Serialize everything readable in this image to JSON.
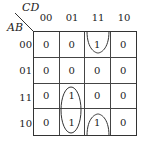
{
  "kmap": {
    "var_col": "CD",
    "var_row": "AB",
    "col_headers": [
      "00",
      "01",
      "11",
      "10"
    ],
    "row_headers": [
      "00",
      "01",
      "11",
      "10"
    ],
    "cells": [
      [
        "0",
        "0",
        "1",
        "0"
      ],
      [
        "0",
        "0",
        "0",
        "0"
      ],
      [
        "0",
        "1",
        "0",
        "0"
      ],
      [
        "0",
        "1",
        "1",
        "0"
      ]
    ],
    "groups": [
      {
        "cells": [
          [
            0,
            2
          ],
          [
            3,
            2
          ]
        ],
        "shape": "wrap-around pair (column 11, rows 00 and 10)"
      },
      {
        "cells": [
          [
            2,
            1
          ],
          [
            3,
            1
          ]
        ],
        "shape": "vertical oval (column 01, rows 11 and 10)"
      }
    ]
  }
}
